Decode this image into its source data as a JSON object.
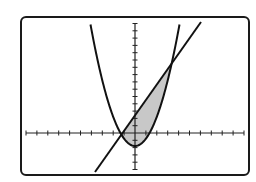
{
  "figure": {
    "colors": {
      "background": "#ffffff",
      "frame": "#1a1a1a",
      "curve": "#111111",
      "shade": "#c8c8c8"
    },
    "axes": {
      "x_ticks_left": 10,
      "x_ticks_right": 10,
      "y_ticks_up": 15,
      "y_ticks_down": 5
    },
    "curves": [
      {
        "name": "parabola",
        "kind": "quadratic",
        "vertex_px": [
          135,
          146
        ]
      },
      {
        "name": "line",
        "kind": "linear",
        "from_px": [
          95,
          172
        ],
        "to_px": [
          201,
          22
        ]
      }
    ],
    "shaded_region": "area bounded between line and parabola from left intersection to right intersection"
  }
}
